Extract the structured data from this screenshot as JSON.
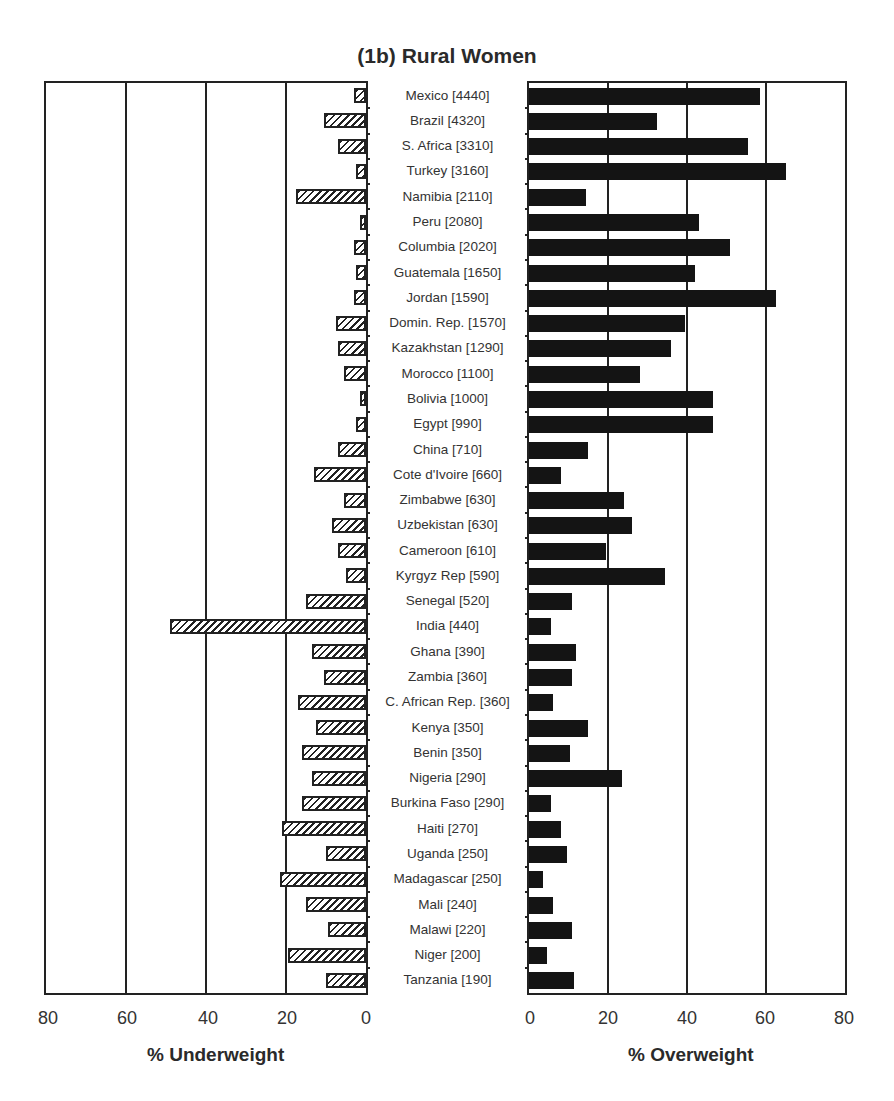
{
  "chart_data": {
    "type": "bar",
    "title": "(1b) Rural Women",
    "orientation": "horizontal",
    "layout": "back-to-back (butterfly)",
    "grid": true,
    "categories": [
      "Mexico [4440]",
      "Brazil [4320]",
      "S. Africa [3310]",
      "Turkey [3160]",
      "Namibia [2110]",
      "Peru [2080]",
      "Columbia [2020]",
      "Guatemala [1650]",
      "Jordan [1590]",
      "Domin. Rep. [1570]",
      "Kazakhstan [1290]",
      "Morocco [1100]",
      "Bolivia [1000]",
      "Egypt [990]",
      "China [710]",
      "Cote d'Ivoire [660]",
      "Zimbabwe [630]",
      "Uzbekistan [630]",
      "Cameroon [610]",
      "Kyrgyz Rep [590]",
      "Senegal [520]",
      "India [440]",
      "Ghana [390]",
      "Zambia [360]",
      "C. African Rep. [360]",
      "Kenya [350]",
      "Benin [350]",
      "Nigeria [290]",
      "Burkina Faso [290]",
      "Haiti [270]",
      "Uganda [250]",
      "Madagascar [250]",
      "Mali [240]",
      "Malawi [220]",
      "Niger [200]",
      "Tanzania [190]"
    ],
    "series": [
      {
        "name": "% Underweight",
        "style": "hatched",
        "direction": "left",
        "values": [
          3,
          10.5,
          7,
          2.5,
          17.5,
          1.5,
          3,
          2.5,
          3,
          7.5,
          7,
          5.5,
          1.5,
          2.5,
          7,
          13,
          5.5,
          8.5,
          7,
          5,
          15,
          49,
          13.5,
          10.5,
          17,
          12.5,
          16,
          13.5,
          16,
          21,
          10,
          21.5,
          15,
          9.5,
          19.5,
          10
        ]
      },
      {
        "name": "% Overweight",
        "style": "solid",
        "direction": "right",
        "values": [
          58.5,
          32.5,
          55.5,
          65,
          14.5,
          43,
          51,
          42,
          62.5,
          39.5,
          36,
          28,
          46.5,
          46.5,
          15,
          8,
          24,
          26,
          19.5,
          34.5,
          11,
          5.5,
          12,
          11,
          6,
          15,
          10.5,
          23.5,
          5.5,
          8,
          9.5,
          3.5,
          6,
          11,
          4.5,
          11.5
        ]
      }
    ],
    "left_axis": {
      "xlabel": "% Underweight",
      "ticks": [
        "80",
        "60",
        "40",
        "20",
        "0"
      ],
      "xlim": [
        80,
        0
      ]
    },
    "right_axis": {
      "xlabel": "% Overweight",
      "ticks": [
        "0",
        "20",
        "40",
        "60",
        "80"
      ],
      "xlim": [
        0,
        80
      ]
    },
    "colors": {
      "overweight_fill": "#141414",
      "underweight_hatch": "#222222",
      "grid": "#222222"
    }
  }
}
